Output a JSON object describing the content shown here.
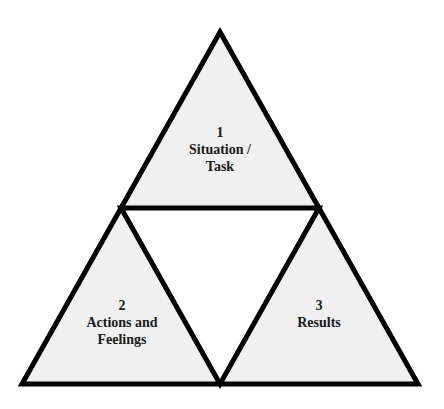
{
  "diagram": {
    "title": "",
    "colors": {
      "stroke": "#000000",
      "segment_fill": "#f0f0f0",
      "center_fill": "#ffffff",
      "text": "#1a1a1a"
    },
    "segments": [
      {
        "id": "top",
        "number": "1",
        "lines": [
          "Situation /",
          "Task"
        ]
      },
      {
        "id": "bottom-left",
        "number": "2",
        "lines": [
          "Actions and",
          "Feelings"
        ]
      },
      {
        "id": "bottom-right",
        "number": "3",
        "lines": [
          "Results"
        ]
      }
    ]
  }
}
